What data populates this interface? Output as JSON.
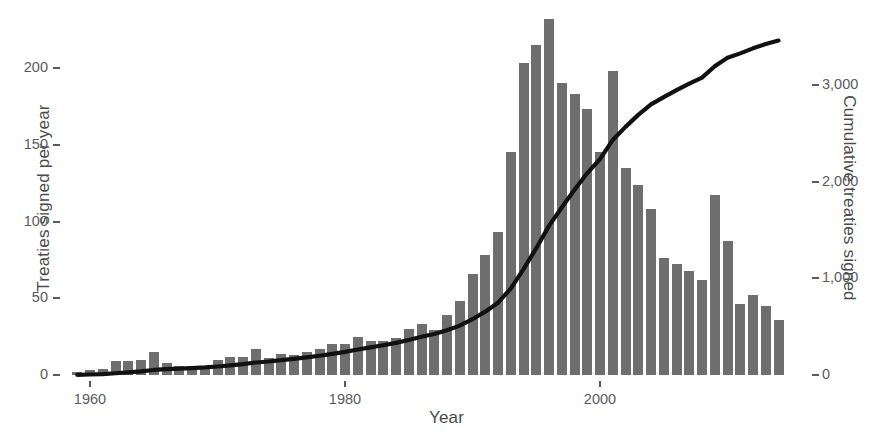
{
  "chart_data": {
    "type": "bar",
    "title": "",
    "subtitle": "",
    "xlabel": "Year",
    "ylabel": "Treaties signed per year",
    "ylabel_right": "Cumulative treaties signed",
    "grid": false,
    "legend": "none",
    "xlim": [
      1958,
      2015
    ],
    "ylim": [
      0,
      240
    ],
    "ylim_right": [
      0,
      3700
    ],
    "xticks": [
      1960,
      1980,
      2000
    ],
    "xtick_labels": [
      "1960",
      "1980",
      "2000"
    ],
    "yticks": [
      0,
      50,
      100,
      150,
      200
    ],
    "ytick_labels": [
      "0",
      "50",
      "100",
      "150",
      "200"
    ],
    "yticks_right": [
      0,
      1000,
      2000,
      3000
    ],
    "ytick_labels_right": [
      "0",
      "1,000",
      "2,000",
      "3,000"
    ],
    "colors": {
      "bar": "#6e6e6e",
      "line": "#111111",
      "text": "#4a4a4a",
      "tick": "#5a5a5a",
      "background": "#ffffff"
    },
    "series": [
      {
        "name": "Treaties signed per year",
        "type": "bar",
        "axis": "left",
        "x": [
          1959,
          1960,
          1961,
          1962,
          1963,
          1964,
          1965,
          1966,
          1967,
          1968,
          1969,
          1970,
          1971,
          1972,
          1973,
          1974,
          1975,
          1976,
          1977,
          1978,
          1979,
          1980,
          1981,
          1982,
          1983,
          1984,
          1985,
          1986,
          1987,
          1988,
          1989,
          1990,
          1991,
          1992,
          1993,
          1994,
          1995,
          1996,
          1997,
          1998,
          1999,
          2000,
          2001,
          2002,
          2003,
          2004,
          2005,
          2006,
          2007,
          2008,
          2009,
          2010,
          2011,
          2012,
          2013,
          2014
        ],
        "values": [
          2,
          3,
          4,
          9,
          9,
          10,
          15,
          8,
          6,
          6,
          6,
          10,
          12,
          12,
          17,
          11,
          14,
          13,
          15,
          17,
          20,
          20,
          25,
          22,
          22,
          24,
          30,
          33,
          29,
          39,
          48,
          66,
          78,
          93,
          145,
          203,
          215,
          232,
          190,
          183,
          173,
          145,
          198,
          135,
          124,
          108,
          76,
          72,
          68,
          62,
          117,
          87,
          46,
          52,
          45,
          36
        ]
      },
      {
        "name": "Cumulative treaties signed",
        "type": "line",
        "axis": "right",
        "x": [
          1959,
          1960,
          1961,
          1962,
          1963,
          1964,
          1965,
          1966,
          1967,
          1968,
          1969,
          1970,
          1971,
          1972,
          1973,
          1974,
          1975,
          1976,
          1977,
          1978,
          1979,
          1980,
          1981,
          1982,
          1983,
          1984,
          1985,
          1986,
          1987,
          1988,
          1989,
          1990,
          1991,
          1992,
          1993,
          1994,
          1995,
          1996,
          1997,
          1998,
          1999,
          2000,
          2001,
          2002,
          2003,
          2004,
          2005,
          2006,
          2007,
          2008,
          2009,
          2010,
          2011,
          2012,
          2013,
          2014
        ],
        "values": [
          2,
          5,
          9,
          18,
          27,
          37,
          52,
          60,
          66,
          72,
          78,
          88,
          100,
          112,
          129,
          140,
          154,
          167,
          182,
          199,
          219,
          239,
          264,
          286,
          308,
          332,
          362,
          395,
          424,
          463,
          511,
          577,
          655,
          748,
          893,
          1096,
          1311,
          1543,
          1733,
          1916,
          2089,
          2234,
          2432,
          2567,
          2691,
          2799,
          2875,
          2947,
          3015,
          3077,
          3194,
          3281,
          3327,
          3379,
          3424,
          3460
        ]
      }
    ]
  }
}
